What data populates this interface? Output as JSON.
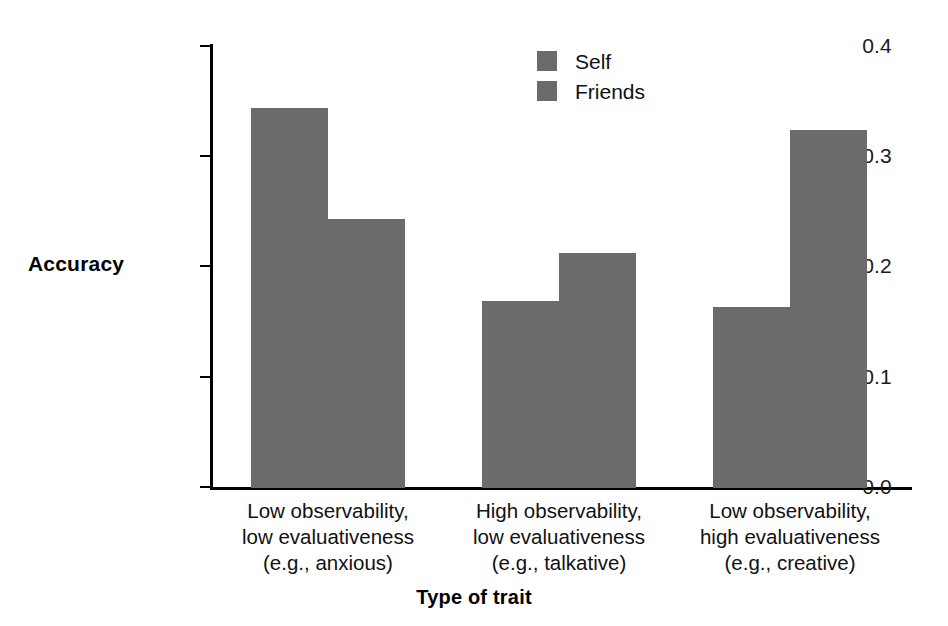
{
  "chart_data": {
    "type": "bar",
    "title": "",
    "subtitle": "",
    "xlabel": "Type of trait",
    "ylabel": "Accuracy",
    "ylim": [
      0.0,
      0.4
    ],
    "yticks": [
      "0.0",
      "0.1",
      "0.2",
      "0.3",
      "0.4"
    ],
    "ytick_values": [
      0.0,
      0.1,
      0.2,
      0.3,
      0.4
    ],
    "grid": false,
    "legend_position": "top-center",
    "bar_color": "#6b6b6b",
    "axis_color": "#000000",
    "background": "#ffffff",
    "categories": [
      "Low observability, low evaluativeness (e.g., anxious)",
      "High observability, low evaluativeness (e.g., talkative)",
      "Low observability, high evaluativeness (e.g., creative)"
    ],
    "category_lines": [
      [
        "Low observability,",
        "low evaluativeness",
        "(e.g., anxious)"
      ],
      [
        "High observability,",
        "low evaluativeness",
        "(e.g., talkative)"
      ],
      [
        "Low observability,",
        "high evaluativeness",
        "(e.g., creative)"
      ]
    ],
    "series": [
      {
        "name": "Self",
        "values": [
          0.343,
          0.169,
          0.163
        ]
      },
      {
        "name": "Friends",
        "values": [
          0.243,
          0.212,
          0.323
        ]
      }
    ]
  },
  "legend": {
    "items": [
      {
        "label": "Self",
        "color": "#6b6b6b"
      },
      {
        "label": "Friends",
        "color": "#6b6b6b"
      }
    ]
  }
}
